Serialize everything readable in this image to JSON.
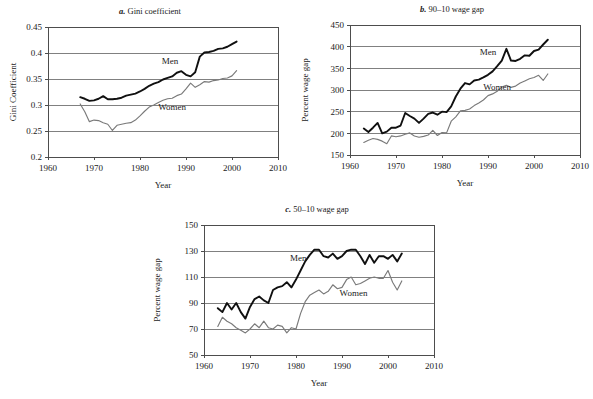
{
  "figure": {
    "background": "#ffffff",
    "men_color": "#101010",
    "women_color": "#7a7a7a",
    "grid_color": "#808080"
  },
  "chart_data": [
    {
      "id": "a",
      "type": "line",
      "panel_letter": "a.",
      "title": "Gini coefficient",
      "title_full": "a. Gini coefficient",
      "xlabel": "Year",
      "ylabel": "Gini Coefficient",
      "xlim": [
        1960,
        2010
      ],
      "ylim": [
        0.2,
        0.45
      ],
      "xticks": [
        1960,
        1970,
        1980,
        1990,
        2000,
        2010
      ],
      "yticks": [
        0.2,
        0.25,
        0.3,
        0.35,
        0.4,
        0.45
      ],
      "xtick_labels": [
        "1960",
        "1970",
        "1980",
        "1990",
        "2000",
        "2010"
      ],
      "ytick_labels": [
        "0.2",
        "0.25",
        "0.3",
        "0.35",
        "0.4",
        "0.45"
      ],
      "grid": true,
      "legend_position": "inline-annotation",
      "annotations": [
        {
          "text": "Men",
          "x": 1986.5,
          "y": 0.379
        },
        {
          "text": "Women",
          "x": 1987.0,
          "y": 0.291
        }
      ],
      "series": [
        {
          "name": "Men",
          "color": "#101010",
          "x": [
            1967,
            1968,
            1969,
            1970,
            1971,
            1972,
            1973,
            1974,
            1975,
            1976,
            1977,
            1978,
            1979,
            1980,
            1981,
            1982,
            1983,
            1984,
            1985,
            1986,
            1987,
            1988,
            1989,
            1990,
            1991,
            1992,
            1993,
            1994,
            1995,
            1996,
            1997,
            1998,
            1999,
            2000,
            2001
          ],
          "values": [
            0.315,
            0.312,
            0.308,
            0.309,
            0.312,
            0.317,
            0.311,
            0.311,
            0.312,
            0.314,
            0.318,
            0.32,
            0.322,
            0.326,
            0.331,
            0.337,
            0.341,
            0.344,
            0.349,
            0.352,
            0.355,
            0.362,
            0.365,
            0.358,
            0.355,
            0.363,
            0.393,
            0.401,
            0.402,
            0.404,
            0.408,
            0.409,
            0.412,
            0.417,
            0.422
          ]
        },
        {
          "name": "Women",
          "color": "#7a7a7a",
          "x": [
            1967,
            1968,
            1969,
            1970,
            1971,
            1972,
            1973,
            1974,
            1975,
            1976,
            1977,
            1978,
            1979,
            1980,
            1981,
            1982,
            1983,
            1984,
            1985,
            1986,
            1987,
            1988,
            1989,
            1990,
            1991,
            1992,
            1993,
            1994,
            1995,
            1996,
            1997,
            1998,
            1999,
            2000,
            2001
          ],
          "values": [
            0.302,
            0.287,
            0.268,
            0.271,
            0.27,
            0.266,
            0.263,
            0.251,
            0.261,
            0.263,
            0.265,
            0.266,
            0.271,
            0.279,
            0.288,
            0.296,
            0.3,
            0.305,
            0.309,
            0.312,
            0.313,
            0.318,
            0.321,
            0.331,
            0.342,
            0.334,
            0.339,
            0.345,
            0.344,
            0.347,
            0.348,
            0.351,
            0.352,
            0.356,
            0.366
          ]
        }
      ]
    },
    {
      "id": "b",
      "type": "line",
      "panel_letter": "b.",
      "title": "90–10 wage gap",
      "title_full": "b. 90–10 wage gap",
      "xlabel": "Year",
      "ylabel": "Percent wage gap",
      "xlim": [
        1960,
        2010
      ],
      "ylim": [
        150,
        450
      ],
      "xticks": [
        1960,
        1970,
        1980,
        1990,
        2000,
        2010
      ],
      "yticks": [
        150,
        200,
        250,
        300,
        350,
        400,
        450
      ],
      "xtick_labels": [
        "1960",
        "1970",
        "1980",
        "1990",
        "2000",
        "2010"
      ],
      "ytick_labels": [
        "150",
        "200",
        "250",
        "300",
        "350",
        "400",
        "450"
      ],
      "grid": true,
      "legend_position": "inline-annotation",
      "annotations": [
        {
          "text": "Men",
          "x": 1990.0,
          "y": 381
        },
        {
          "text": "Women",
          "x": 1992.0,
          "y": 301
        }
      ],
      "series": [
        {
          "name": "Men",
          "color": "#101010",
          "x": [
            1963,
            1964,
            1965,
            1966,
            1967,
            1968,
            1969,
            1970,
            1971,
            1972,
            1973,
            1974,
            1975,
            1976,
            1977,
            1978,
            1979,
            1980,
            1981,
            1982,
            1983,
            1984,
            1985,
            1986,
            1987,
            1988,
            1989,
            1990,
            1991,
            1992,
            1993,
            1994,
            1995,
            1996,
            1997,
            1998,
            1999,
            2000,
            2001,
            2002,
            2003
          ],
          "values": [
            211,
            203,
            213,
            224,
            200,
            204,
            213,
            213,
            218,
            247,
            240,
            234,
            224,
            234,
            245,
            248,
            243,
            250,
            249,
            262,
            285,
            303,
            316,
            313,
            322,
            324,
            329,
            335,
            343,
            355,
            368,
            395,
            368,
            367,
            372,
            380,
            379,
            390,
            393,
            405,
            416
          ]
        },
        {
          "name": "Women",
          "color": "#7a7a7a",
          "x": [
            1963,
            1964,
            1965,
            1966,
            1967,
            1968,
            1969,
            1970,
            1971,
            1972,
            1973,
            1974,
            1975,
            1976,
            1977,
            1978,
            1979,
            1980,
            1981,
            1982,
            1983,
            1984,
            1985,
            1986,
            1987,
            1988,
            1989,
            1990,
            1991,
            1992,
            1993,
            1994,
            1995,
            1996,
            1997,
            1998,
            1999,
            2000,
            2001,
            2002,
            2003
          ],
          "values": [
            179,
            184,
            188,
            186,
            182,
            176,
            194,
            192,
            194,
            198,
            201,
            194,
            191,
            193,
            196,
            207,
            195,
            202,
            201,
            228,
            238,
            252,
            253,
            256,
            264,
            270,
            277,
            287,
            291,
            297,
            307,
            311,
            306,
            309,
            316,
            321,
            326,
            329,
            334,
            322,
            337
          ]
        }
      ]
    },
    {
      "id": "c",
      "type": "line",
      "panel_letter": "c.",
      "title": "50–10 wage gap",
      "title_full": "c. 50–10 wage gap",
      "xlabel": "Year",
      "ylabel": "Percent wage gap",
      "xlim": [
        1960,
        2010
      ],
      "ylim": [
        50,
        150
      ],
      "xticks": [
        1960,
        1970,
        1980,
        1990,
        2000,
        2010
      ],
      "yticks": [
        50,
        70,
        90,
        110,
        130,
        150
      ],
      "xtick_labels": [
        "1960",
        "1970",
        "1980",
        "1990",
        "2000",
        "2010"
      ],
      "ytick_labels": [
        "50",
        "70",
        "90",
        "110",
        "130",
        "150"
      ],
      "grid": true,
      "legend_position": "inline-annotation",
      "annotations": [
        {
          "text": "Men",
          "x": 1980.5,
          "y": 122.5
        },
        {
          "text": "Women",
          "x": 1992.5,
          "y": 95.5
        }
      ],
      "series": [
        {
          "name": "Men",
          "color": "#101010",
          "x": [
            1963,
            1964,
            1965,
            1966,
            1967,
            1968,
            1969,
            1970,
            1971,
            1972,
            1973,
            1974,
            1975,
            1976,
            1977,
            1978,
            1979,
            1980,
            1981,
            1982,
            1983,
            1984,
            1985,
            1986,
            1987,
            1988,
            1989,
            1990,
            1991,
            1992,
            1993,
            1994,
            1995,
            1996,
            1997,
            1998,
            1999,
            2000,
            2001,
            2002,
            2003
          ],
          "values": [
            86,
            83,
            90,
            85,
            90,
            83,
            78,
            87,
            93,
            95,
            92,
            90,
            100,
            102,
            103,
            106,
            102,
            108,
            115,
            122,
            127,
            131,
            131,
            126,
            125,
            128,
            124,
            126,
            130,
            131,
            131,
            126,
            120,
            127,
            121,
            126,
            126,
            124,
            127,
            122,
            128
          ]
        },
        {
          "name": "Women",
          "color": "#7a7a7a",
          "x": [
            1963,
            1964,
            1965,
            1966,
            1967,
            1968,
            1969,
            1970,
            1971,
            1972,
            1973,
            1974,
            1975,
            1976,
            1977,
            1978,
            1979,
            1980,
            1981,
            1982,
            1983,
            1984,
            1985,
            1986,
            1987,
            1988,
            1989,
            1990,
            1991,
            1992,
            1993,
            1994,
            1995,
            1996,
            1997,
            1998,
            1999,
            2000,
            2001,
            2002,
            2003
          ],
          "values": [
            72,
            79,
            76,
            74,
            71,
            69,
            67,
            70,
            74,
            71,
            76,
            71,
            70,
            73,
            72,
            67,
            71,
            70,
            82,
            91,
            96,
            98,
            100,
            97,
            99,
            104,
            101,
            102,
            108,
            110,
            104,
            105,
            107,
            109,
            110,
            109,
            109,
            115,
            106,
            100,
            107
          ]
        }
      ]
    }
  ]
}
